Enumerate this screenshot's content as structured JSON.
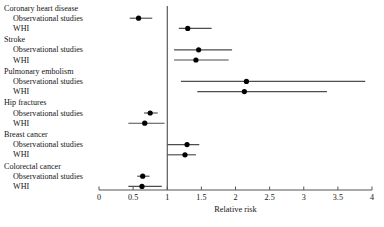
{
  "chart_data": {
    "type": "scatter",
    "title": "",
    "xlabel": "Relative risk",
    "ylabel": "",
    "xlim": [
      0,
      4
    ],
    "xticks": [
      0,
      0.5,
      1,
      1.5,
      2,
      2.5,
      3,
      3.5,
      4
    ],
    "xtick_labels": [
      "0",
      "0.5",
      "1",
      "1.5",
      "2",
      "2.5",
      "3",
      "3.5",
      "4"
    ],
    "grid": false,
    "legend": null,
    "reference_line": 1,
    "marker_color": "#000000",
    "line_color": "#4d4d4d",
    "axis_color": "#555555",
    "groups": [
      {
        "name": "Coronary heart disease",
        "rows": [
          {
            "label": "Observational studies",
            "estimate": 0.58,
            "ci_low": 0.45,
            "ci_high": 0.78
          },
          {
            "label": "WHI",
            "estimate": 1.3,
            "ci_low": 1.17,
            "ci_high": 1.65
          }
        ]
      },
      {
        "name": "Stroke",
        "rows": [
          {
            "label": "Observational studies",
            "estimate": 1.46,
            "ci_low": 1.1,
            "ci_high": 1.95
          },
          {
            "label": "WHI",
            "estimate": 1.42,
            "ci_low": 1.1,
            "ci_high": 1.9
          }
        ]
      },
      {
        "name": "Pulmonary embolism",
        "rows": [
          {
            "label": "Observational studies",
            "estimate": 2.16,
            "ci_low": 1.2,
            "ci_high": 3.9
          },
          {
            "label": "WHI",
            "estimate": 2.13,
            "ci_low": 1.44,
            "ci_high": 3.34
          }
        ]
      },
      {
        "name": "Hip fractures",
        "rows": [
          {
            "label": "Observational studies",
            "estimate": 0.75,
            "ci_low": 0.66,
            "ci_high": 0.86
          },
          {
            "label": "WHI",
            "estimate": 0.67,
            "ci_low": 0.43,
            "ci_high": 0.96
          }
        ]
      },
      {
        "name": "Breast cancer",
        "rows": [
          {
            "label": "Observational studies",
            "estimate": 1.29,
            "ci_low": 1.0,
            "ci_high": 1.47
          },
          {
            "label": "WHI",
            "estimate": 1.26,
            "ci_low": 1.0,
            "ci_high": 1.42
          }
        ]
      },
      {
        "name": "Colorectal cancer",
        "rows": [
          {
            "label": "Observational studies",
            "estimate": 0.64,
            "ci_low": 0.56,
            "ci_high": 0.74
          },
          {
            "label": "WHI",
            "estimate": 0.63,
            "ci_low": 0.43,
            "ci_high": 0.92
          }
        ]
      }
    ]
  }
}
